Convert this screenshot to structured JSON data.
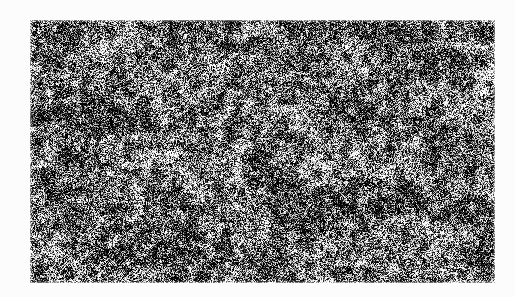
{
  "page": {
    "width": 515,
    "height": 297,
    "background_color": "#fcfcfc",
    "margin_color": "#fcfcfc"
  },
  "image_plate": {
    "name": "grayscale-granular-texture",
    "description": "Dense high-contrast black-and-white granular noise field resembling a scanned micrograph or coarse halftone, with fine light filament networks forming an irregular web over a dark mottled background",
    "x": 30,
    "y": 20,
    "width": 465,
    "height": 263,
    "colors": {
      "darkest": "#050505",
      "dark": "#1c1c1c",
      "mid": "#6e6e6e",
      "light": "#c8c8c8",
      "lightest": "#f5f5f5",
      "mean_tone": "#5e5e5e"
    },
    "texture": {
      "type": "granular-noise",
      "grain_scale_px": 1,
      "cluster_scale_px": 9,
      "band_scale_px": 46,
      "contrast": 1.55,
      "mean_luminance": 0.38,
      "filament_density": 0.34,
      "seed": 20250714
    }
  },
  "chart_data": {
    "type": "heatmap",
    "title": "",
    "xlabel": "",
    "ylabel": "",
    "grid": false,
    "legend": false,
    "colormap": "grayscale",
    "value_range": [
      0,
      1
    ]
  }
}
